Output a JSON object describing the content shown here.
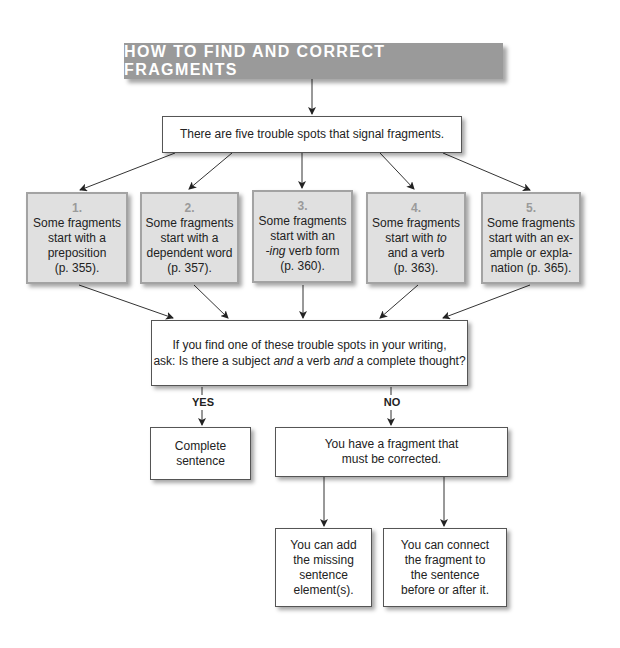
{
  "title": "HOW TO FIND AND CORRECT FRAGMENTS",
  "intro": "There are five trouble spots that signal fragments.",
  "trouble_spots": [
    {
      "number": "1.",
      "lines": [
        "Some fragments",
        "start with a",
        "preposition",
        "(p. 355)."
      ]
    },
    {
      "number": "2.",
      "lines": [
        "Some fragments",
        "start with a",
        "dependent word",
        "(p. 357)."
      ]
    },
    {
      "number": "3.",
      "lines": [
        "Some fragments",
        "start with an",
        "-ing verb form",
        "(p. 360)."
      ]
    },
    {
      "number": "4.",
      "lines": [
        "Some fragments",
        "start with to",
        "and a verb",
        "(p. 363)."
      ]
    },
    {
      "number": "5.",
      "lines": [
        "Some fragments",
        "start with an ex-",
        "ample or expla-",
        "nation (p. 365)."
      ]
    }
  ],
  "question": {
    "line1": "If you find one of these trouble spots in your writing,",
    "line2_parts": [
      "ask: Is there a subject ",
      "and",
      " a verb ",
      "and",
      " a complete thought?"
    ]
  },
  "branches": {
    "yes_label": "YES",
    "no_label": "NO"
  },
  "yes_result": [
    "Complete",
    "sentence"
  ],
  "no_result": [
    "You have a fragment that",
    "must be corrected."
  ],
  "fixes": [
    {
      "lines": [
        "You can add",
        "the missing",
        "sentence",
        "element(s)."
      ]
    },
    {
      "lines": [
        "You can connect",
        "the fragment to",
        "the sentence",
        "before or after it."
      ]
    }
  ],
  "colors": {
    "title_bg": "#9a9a9a",
    "title_text": "#ffffff",
    "spot_bg": "#e0e0e0",
    "spot_border": "#a3a3a3",
    "spot_number": "#9a9a9a",
    "line": "#333333"
  }
}
